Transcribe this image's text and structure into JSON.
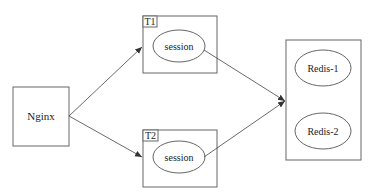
{
  "diagram": {
    "nodes": {
      "nginx": {
        "label": "Nginx"
      },
      "t1": {
        "tag": "T1",
        "session_label": "session"
      },
      "t2": {
        "tag": "T2",
        "session_label": "session"
      },
      "redis": {
        "items": [
          {
            "label": "Redis-1"
          },
          {
            "label": "Redis-2"
          }
        ]
      }
    },
    "edges": [
      {
        "from": "Nginx",
        "to": "T1"
      },
      {
        "from": "Nginx",
        "to": "T2"
      },
      {
        "from": "T1 session",
        "to": "Redis cluster"
      },
      {
        "from": "T2 session",
        "to": "Redis cluster"
      }
    ],
    "colors": {
      "stroke": "#666666",
      "text": "#222222",
      "arrow": "#333333"
    }
  }
}
